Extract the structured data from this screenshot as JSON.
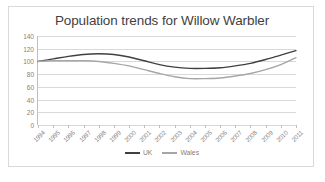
{
  "chart_data": {
    "type": "line",
    "title": "Population trends for Willow Warbler",
    "xlabel": "",
    "ylabel": "",
    "ylim": [
      0,
      140
    ],
    "yticks": [
      0,
      20,
      40,
      60,
      80,
      100,
      120,
      140
    ],
    "grid": true,
    "legend_position": "bottom",
    "categories": [
      "1994",
      "1995",
      "1996",
      "1997",
      "1998",
      "1999",
      "2000",
      "2001",
      "2002",
      "2003",
      "2004",
      "2005",
      "2006",
      "2007",
      "2008",
      "2009",
      "2010",
      "2011"
    ],
    "series": [
      {
        "name": "UK",
        "color": "#404040",
        "values": [
          100,
          104,
          108,
          111,
          112,
          111,
          107,
          101,
          95,
          91,
          89,
          89,
          90,
          93,
          97,
          103,
          110,
          117
        ]
      },
      {
        "name": "Wales",
        "color": "#a6a6a6",
        "values": [
          100,
          101,
          101,
          101,
          100,
          97,
          93,
          87,
          81,
          76,
          73,
          73,
          74,
          77,
          81,
          87,
          95,
          106
        ]
      }
    ]
  },
  "legend": {
    "entries": [
      {
        "label": "UK",
        "color": "#404040"
      },
      {
        "label": "Wales",
        "color": "#a6a6a6"
      }
    ]
  },
  "colors": {
    "uk_line": "#404040",
    "wales_line": "#a6a6a6",
    "gridline": "#d9d9d9",
    "axis": "#bfbfbf",
    "tick_text": "#7f7f7f",
    "title_text": "#3f3f3f",
    "frame_border": "#d9d9d9",
    "background": "#ffffff"
  }
}
